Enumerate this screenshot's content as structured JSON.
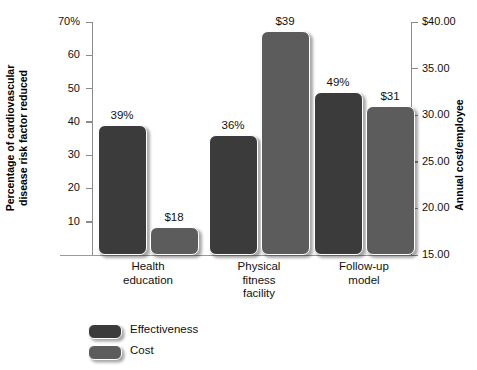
{
  "chart_data": {
    "type": "bar",
    "title": "",
    "categories": [
      "Health education",
      "Physical fitness facility",
      "Follow-up model"
    ],
    "series": [
      {
        "name": "Effectiveness",
        "axis": "left",
        "unit": "%",
        "color": "#3b3b3b",
        "values": [
          39,
          36,
          49
        ],
        "labels": [
          "39%",
          "36%",
          "49%"
        ]
      },
      {
        "name": "Cost",
        "axis": "right",
        "unit": "$",
        "color": "#5c5c5c",
        "values": [
          18,
          39,
          31
        ],
        "labels": [
          "$18",
          "$39",
          "$31"
        ]
      }
    ],
    "ylabel": "Percentage of cardiovascular\ndisease risk factor reduced",
    "ylabel_right": "Annual cost/employee",
    "xlabel": "",
    "ylim": [
      0,
      70
    ],
    "ylim_right": [
      15,
      40
    ],
    "yticks_left": [
      "70%",
      "60",
      "50",
      "40",
      "30",
      "20",
      "10"
    ],
    "ytick_values_left": [
      70,
      60,
      50,
      40,
      30,
      20,
      10
    ],
    "yticks_right": [
      "$40.00",
      "35.00",
      "30.00",
      "25.00",
      "20.00",
      "15.00"
    ],
    "ytick_values_right": [
      40,
      35,
      30,
      25,
      20,
      15
    ],
    "grid": false,
    "legend_position": "bottom-left",
    "legend": [
      "Effectiveness",
      "Cost"
    ]
  },
  "axes": {
    "left_title": "Percentage of cardiovascular\ndisease risk factor reduced",
    "right_title": "Annual cost/employee"
  },
  "ticks": {
    "left": [
      {
        "label": "70%",
        "value": 70
      },
      {
        "label": "60",
        "value": 60
      },
      {
        "label": "50",
        "value": 50
      },
      {
        "label": "40",
        "value": 40
      },
      {
        "label": "30",
        "value": 30
      },
      {
        "label": "20",
        "value": 20
      },
      {
        "label": "10",
        "value": 10
      }
    ],
    "right": [
      {
        "label": "$40.00",
        "value": 40
      },
      {
        "label": "35.00",
        "value": 35
      },
      {
        "label": "30.00",
        "value": 30
      },
      {
        "label": "25.00",
        "value": 25
      },
      {
        "label": "20.00",
        "value": 20
      },
      {
        "label": "15.00",
        "value": 15
      }
    ]
  },
  "categories": [
    {
      "label": "Health\neducation",
      "effectiveness": "39%",
      "cost": "$18"
    },
    {
      "label": "Physical\nfitness\nfacility",
      "effectiveness": "36%",
      "cost": "$39"
    },
    {
      "label": "Follow-up\nmodel",
      "effectiveness": "49%",
      "cost": "$31"
    }
  ],
  "legend": {
    "items": [
      {
        "label": "Effectiveness",
        "color": "#3b3b3b"
      },
      {
        "label": "Cost",
        "color": "#5c5c5c"
      }
    ]
  }
}
